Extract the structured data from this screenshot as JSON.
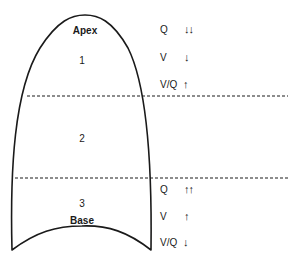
{
  "diagram": {
    "type": "lung ventilation-perfusion zones",
    "labels": {
      "apex": "Apex",
      "base": "Base",
      "zone1": "1",
      "zone2": "2",
      "zone3": "3"
    },
    "apex_group": {
      "rows": [
        {
          "variable": "Q",
          "arrows": "↓↓",
          "direction": "decrease-strong"
        },
        {
          "variable": "V",
          "arrows": "↓",
          "direction": "decrease"
        },
        {
          "variable": "V/Q",
          "arrows": "↑",
          "direction": "increase"
        }
      ]
    },
    "base_group": {
      "rows": [
        {
          "variable": "Q",
          "arrows": "↑↑",
          "direction": "increase-strong"
        },
        {
          "variable": "V",
          "arrows": "↑",
          "direction": "increase"
        },
        {
          "variable": "V/Q",
          "arrows": "↓",
          "direction": "decrease"
        }
      ]
    },
    "colors": {
      "line": "#1a1a1a",
      "background": "#ffffff"
    }
  }
}
